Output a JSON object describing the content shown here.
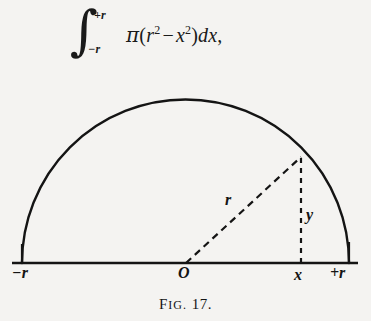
{
  "figure": {
    "caption_prefix_first": "F",
    "caption_prefix_rest": "IG.",
    "caption_number": "17.",
    "caption_full": "FIG. 17."
  },
  "formula": {
    "integral_sign": "∫",
    "upper_limit": "+r",
    "lower_limit": "−r",
    "pi": "π",
    "open_paren": "(",
    "r_base": "r",
    "r_exp": "2",
    "minus": "−",
    "x_base": "x",
    "x_exp": "2",
    "close_paren": ")",
    "differential": "dx",
    "trailing_comma": ",",
    "plain_text": "∫_{-r}^{+r} π(r² − x²)dx,"
  },
  "diagram": {
    "labels": {
      "left_endpoint": "−r",
      "origin": "O",
      "x_point": "x",
      "right_endpoint": "+r",
      "radius": "r",
      "ordinate": "y"
    },
    "geometry": {
      "baseline_y": 185,
      "baseline_x_start": 12,
      "baseline_x_end": 358,
      "center_x": 185,
      "radius_px": 164,
      "arc_apex_y": 22,
      "point_x": 301,
      "point_y": 80
    },
    "colors": {
      "ink": "#141414",
      "paper": "#f4f3f1"
    }
  }
}
